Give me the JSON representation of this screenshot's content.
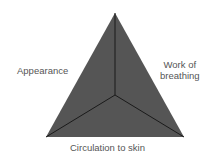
{
  "diagram": {
    "type": "pediatric-assessment-triangle",
    "labels": {
      "left": "Appearance",
      "right_line1": "Work of",
      "right_line2": "breathing",
      "bottom": "Circulation to skin"
    },
    "colors": {
      "fill": "#555555",
      "lines": "#1a1a1a",
      "text": "#555555"
    }
  }
}
